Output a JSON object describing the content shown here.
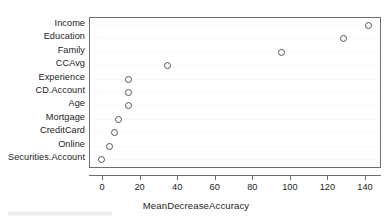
{
  "chart_data": {
    "type": "scatter",
    "title": "",
    "subtitle": "",
    "xlabel": "MeanDecreaseAccuracy",
    "ylabel": "",
    "grid": false,
    "legend": null,
    "xlim": [
      -6,
      146
    ],
    "xticks": [
      0,
      20,
      40,
      60,
      80,
      100,
      120,
      140
    ],
    "xticklabels": [
      "0",
      "20",
      "40",
      "60",
      "80",
      "100",
      "120",
      "140"
    ],
    "categories": [
      "Income",
      "Education",
      "Family",
      "CCAvg",
      "Experience",
      "CD.Account",
      "Age",
      "Mortgage",
      "CreditCard",
      "Online",
      "Securities.Account"
    ],
    "values": [
      141,
      128,
      95,
      34,
      13.5,
      13.5,
      13.5,
      8,
      6,
      3,
      -1
    ],
    "points": [
      {
        "label": "Income",
        "value": 141
      },
      {
        "label": "Education",
        "value": 128
      },
      {
        "label": "Family",
        "value": 95
      },
      {
        "label": "CCAvg",
        "value": 34
      },
      {
        "label": "Experience",
        "value": 13.5
      },
      {
        "label": "CD.Account",
        "value": 13.5
      },
      {
        "label": "Age",
        "value": 13.5
      },
      {
        "label": "Mortgage",
        "value": 8
      },
      {
        "label": "CreditCard",
        "value": 6
      },
      {
        "label": "Online",
        "value": 3
      },
      {
        "label": "Securities.Account",
        "value": -1
      }
    ],
    "marker": "open-circle",
    "colors": {
      "marker_stroke": "#555555",
      "axis": "#6e6e6e",
      "text": "#232323",
      "background": "#ffffff"
    }
  },
  "axis": {
    "x_title": "MeanDecreaseAccuracy",
    "tick_labels": [
      "0",
      "20",
      "40",
      "60",
      "80",
      "100",
      "120",
      "140"
    ]
  },
  "y_axis": {
    "labels": [
      "Income",
      "Education",
      "Family",
      "CCAvg",
      "Experience",
      "CD.Account",
      "Age",
      "Mortgage",
      "CreditCard",
      "Online",
      "Securities.Account"
    ]
  }
}
